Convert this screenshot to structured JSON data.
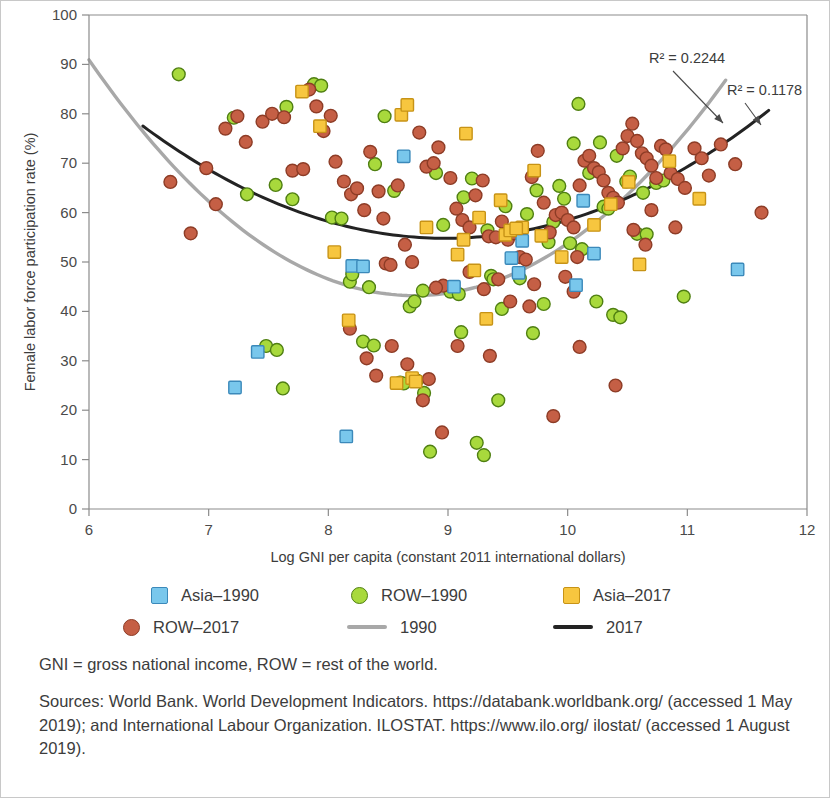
{
  "chart_data": {
    "type": "scatter",
    "title": "",
    "xlabel": "Log GNI per capita (constant 2011 international dollars)",
    "ylabel": "Female labor force participation rate (%)",
    "xlim": [
      6,
      12
    ],
    "ylim": [
      0,
      100
    ],
    "xticks": [
      6,
      7,
      8,
      9,
      10,
      11,
      12
    ],
    "yticks": [
      0,
      10,
      20,
      30,
      40,
      50,
      60,
      70,
      80,
      90,
      100
    ],
    "grid": false,
    "legend_position": "below-plot",
    "annotations": [
      {
        "text": "R² = 0.2244",
        "target_series": "1990",
        "x": 11.3,
        "y": 76
      },
      {
        "text": "R² = 0.1178",
        "target_series": "2017",
        "x": 11.65,
        "y": 74
      }
    ],
    "series": [
      {
        "name": "Asia–1990",
        "marker": "square",
        "color": "#79c7ec",
        "points": [
          [
            7.22,
            24.6
          ],
          [
            7.41,
            31.8
          ],
          [
            8.15,
            14.7
          ],
          [
            8.2,
            49.2
          ],
          [
            8.29,
            49.1
          ],
          [
            8.63,
            71.4
          ],
          [
            9.53,
            50.8
          ],
          [
            9.59,
            47.8
          ],
          [
            10.13,
            62.4
          ],
          [
            10.22,
            51.7
          ],
          [
            11.42,
            48.5
          ],
          [
            9.05,
            45.0
          ],
          [
            9.62,
            54.3
          ],
          [
            10.07,
            45.3
          ]
        ]
      },
      {
        "name": "ROW–1990",
        "marker": "circle",
        "color": "#a8d93c",
        "points": [
          [
            6.75,
            88.0
          ],
          [
            7.21,
            79.2
          ],
          [
            7.32,
            63.7
          ],
          [
            7.56,
            65.6
          ],
          [
            7.65,
            81.4
          ],
          [
            7.7,
            62.7
          ],
          [
            7.88,
            86.0
          ],
          [
            7.94,
            85.7
          ],
          [
            7.48,
            33.0
          ],
          [
            7.57,
            32.2
          ],
          [
            7.62,
            24.4
          ],
          [
            8.03,
            59.0
          ],
          [
            8.11,
            58.8
          ],
          [
            8.18,
            46.0
          ],
          [
            8.2,
            47.5
          ],
          [
            8.34,
            44.9
          ],
          [
            8.39,
            69.8
          ],
          [
            8.47,
            79.5
          ],
          [
            8.55,
            64.4
          ],
          [
            8.29,
            33.9
          ],
          [
            8.38,
            33.1
          ],
          [
            8.6,
            25.6
          ],
          [
            8.63,
            25.4
          ],
          [
            8.68,
            41.0
          ],
          [
            8.72,
            42.0
          ],
          [
            8.74,
            26.0
          ],
          [
            8.8,
            23.5
          ],
          [
            8.79,
            44.2
          ],
          [
            8.85,
            11.6
          ],
          [
            8.96,
            57.5
          ],
          [
            9.02,
            44.0
          ],
          [
            9.09,
            43.5
          ],
          [
            9.11,
            35.8
          ],
          [
            9.13,
            63.1
          ],
          [
            9.2,
            66.9
          ],
          [
            9.24,
            13.4
          ],
          [
            9.3,
            10.9
          ],
          [
            9.33,
            56.4
          ],
          [
            9.36,
            47.2
          ],
          [
            9.38,
            46.5
          ],
          [
            9.42,
            22.0
          ],
          [
            9.48,
            61.3
          ],
          [
            9.55,
            55.8
          ],
          [
            9.6,
            46.7
          ],
          [
            9.66,
            59.7
          ],
          [
            9.71,
            35.6
          ],
          [
            9.74,
            64.5
          ],
          [
            9.8,
            41.5
          ],
          [
            9.88,
            58.1
          ],
          [
            9.93,
            65.4
          ],
          [
            9.97,
            62.8
          ],
          [
            10.02,
            53.8
          ],
          [
            10.05,
            74.0
          ],
          [
            10.09,
            82.0
          ],
          [
            10.12,
            52.6
          ],
          [
            10.18,
            68.0
          ],
          [
            10.24,
            42.0
          ],
          [
            10.3,
            61.2
          ],
          [
            10.34,
            60.8
          ],
          [
            10.38,
            39.3
          ],
          [
            10.44,
            38.8
          ],
          [
            10.49,
            66.3
          ],
          [
            10.52,
            67.3
          ],
          [
            10.58,
            55.7
          ],
          [
            10.66,
            55.6
          ],
          [
            10.74,
            66.0
          ],
          [
            10.8,
            66.5
          ],
          [
            10.97,
            43.0
          ],
          [
            8.9,
            68.0
          ],
          [
            9.45,
            40.5
          ],
          [
            10.27,
            74.2
          ],
          [
            10.41,
            71.5
          ],
          [
            9.84,
            54.0
          ],
          [
            10.63,
            64.0
          ]
        ]
      },
      {
        "name": "Asia–2017",
        "marker": "square",
        "color": "#f7c63f",
        "points": [
          [
            7.78,
            84.5
          ],
          [
            7.93,
            77.5
          ],
          [
            8.61,
            79.8
          ],
          [
            8.66,
            81.8
          ],
          [
            8.05,
            52.0
          ],
          [
            8.17,
            38.2
          ],
          [
            8.57,
            25.5
          ],
          [
            8.7,
            26.5
          ],
          [
            8.73,
            25.8
          ],
          [
            8.82,
            57.0
          ],
          [
            9.08,
            51.5
          ],
          [
            9.13,
            54.5
          ],
          [
            9.22,
            48.3
          ],
          [
            9.26,
            59.0
          ],
          [
            9.32,
            38.5
          ],
          [
            9.44,
            62.5
          ],
          [
            9.48,
            55.5
          ],
          [
            9.52,
            56.4
          ],
          [
            9.62,
            57.0
          ],
          [
            9.72,
            68.5
          ],
          [
            9.78,
            55.3
          ],
          [
            9.95,
            51.0
          ],
          [
            10.22,
            57.5
          ],
          [
            10.36,
            61.7
          ],
          [
            10.51,
            66.2
          ],
          [
            10.85,
            70.4
          ],
          [
            11.1,
            62.8
          ],
          [
            9.15,
            76.0
          ],
          [
            9.57,
            56.8
          ],
          [
            10.6,
            49.5
          ]
        ]
      },
      {
        "name": "ROW–2017",
        "marker": "circle",
        "color": "#c55f45",
        "points": [
          [
            6.68,
            66.2
          ],
          [
            6.85,
            55.8
          ],
          [
            6.98,
            69.0
          ],
          [
            7.06,
            61.7
          ],
          [
            7.14,
            77.0
          ],
          [
            7.24,
            79.5
          ],
          [
            7.31,
            74.3
          ],
          [
            7.45,
            78.4
          ],
          [
            7.53,
            80.0
          ],
          [
            7.63,
            79.3
          ],
          [
            7.7,
            68.5
          ],
          [
            7.79,
            68.8
          ],
          [
            7.84,
            84.9
          ],
          [
            7.9,
            81.5
          ],
          [
            7.96,
            76.5
          ],
          [
            8.02,
            79.6
          ],
          [
            8.06,
            70.3
          ],
          [
            8.13,
            66.3
          ],
          [
            8.19,
            63.7
          ],
          [
            8.24,
            64.9
          ],
          [
            8.3,
            60.5
          ],
          [
            8.35,
            72.3
          ],
          [
            8.42,
            64.3
          ],
          [
            8.48,
            49.7
          ],
          [
            8.52,
            49.4
          ],
          [
            8.58,
            65.5
          ],
          [
            8.64,
            53.5
          ],
          [
            8.7,
            50.0
          ],
          [
            8.76,
            76.2
          ],
          [
            8.82,
            69.3
          ],
          [
            8.88,
            70.0
          ],
          [
            8.92,
            73.2
          ],
          [
            8.18,
            36.5
          ],
          [
            8.32,
            30.5
          ],
          [
            8.4,
            27.0
          ],
          [
            8.53,
            33.0
          ],
          [
            8.66,
            29.3
          ],
          [
            8.79,
            22.0
          ],
          [
            8.84,
            26.3
          ],
          [
            8.95,
            15.5
          ],
          [
            9.02,
            67.0
          ],
          [
            9.07,
            60.8
          ],
          [
            9.12,
            58.5
          ],
          [
            9.18,
            57.0
          ],
          [
            9.23,
            63.5
          ],
          [
            9.29,
            66.5
          ],
          [
            9.34,
            55.2
          ],
          [
            9.4,
            55.0
          ],
          [
            9.45,
            58.2
          ],
          [
            9.5,
            54.5
          ],
          [
            9.55,
            55.8
          ],
          [
            9.6,
            51.0
          ],
          [
            9.65,
            50.5
          ],
          [
            9.7,
            67.2
          ],
          [
            9.75,
            72.5
          ],
          [
            9.8,
            62.0
          ],
          [
            9.85,
            56.0
          ],
          [
            9.9,
            59.5
          ],
          [
            9.95,
            60.0
          ],
          [
            10.0,
            58.5
          ],
          [
            10.05,
            57.0
          ],
          [
            10.1,
            65.5
          ],
          [
            10.14,
            70.5
          ],
          [
            10.18,
            71.5
          ],
          [
            10.22,
            69.0
          ],
          [
            10.26,
            68.2
          ],
          [
            10.3,
            66.5
          ],
          [
            10.34,
            64.0
          ],
          [
            10.38,
            63.0
          ],
          [
            10.42,
            62.0
          ],
          [
            10.46,
            73.0
          ],
          [
            10.5,
            75.5
          ],
          [
            10.54,
            78.0
          ],
          [
            10.58,
            74.5
          ],
          [
            10.62,
            72.0
          ],
          [
            10.66,
            71.0
          ],
          [
            10.7,
            69.5
          ],
          [
            10.74,
            67.0
          ],
          [
            10.78,
            73.5
          ],
          [
            10.82,
            72.8
          ],
          [
            10.86,
            68.0
          ],
          [
            10.92,
            66.8
          ],
          [
            10.98,
            65.0
          ],
          [
            11.06,
            73.0
          ],
          [
            11.12,
            71.0
          ],
          [
            11.28,
            73.8
          ],
          [
            11.4,
            69.8
          ],
          [
            11.62,
            60.0
          ],
          [
            9.08,
            33.0
          ],
          [
            9.35,
            31.0
          ],
          [
            9.52,
            42.0
          ],
          [
            9.68,
            41.0
          ],
          [
            9.88,
            18.8
          ],
          [
            10.1,
            32.8
          ],
          [
            10.4,
            25.0
          ],
          [
            10.65,
            53.5
          ],
          [
            10.9,
            57.0
          ],
          [
            8.96,
            45.2
          ],
          [
            9.72,
            45.5
          ],
          [
            9.3,
            44.5
          ],
          [
            8.46,
            58.8
          ],
          [
            9.98,
            47.0
          ],
          [
            10.05,
            44.0
          ],
          [
            10.55,
            56.5
          ],
          [
            9.18,
            48.0
          ],
          [
            8.9,
            44.8
          ],
          [
            9.42,
            46.5
          ],
          [
            10.08,
            51.0
          ],
          [
            10.7,
            60.5
          ],
          [
            11.18,
            67.5
          ]
        ]
      }
    ],
    "trendlines": [
      {
        "name": "1990",
        "color": "#a8a8a8",
        "r_squared": "R² = 0.2244",
        "x_start": 6.0,
        "x_end": 11.32,
        "vertex_x": 8.72,
        "vertex_y": 43.2,
        "curvature": 6.45
      },
      {
        "name": "2017",
        "color": "#232323",
        "r_squared": "R² = 0.1178",
        "x_start": 6.45,
        "x_end": 11.68,
        "vertex_x": 8.98,
        "vertex_y": 54.8,
        "curvature": 3.55
      }
    ]
  },
  "legend": {
    "items": [
      {
        "label": "Asia–1990",
        "marker": "square",
        "color": "#79c7ec",
        "edge": "#3b89ba"
      },
      {
        "label": "ROW–1990",
        "marker": "circle",
        "color": "#a8d93c",
        "edge": "#4f7f12"
      },
      {
        "label": "Asia–2017",
        "marker": "square",
        "color": "#f7c63f",
        "edge": "#c79316"
      },
      {
        "label": "ROW–2017",
        "marker": "circle",
        "color": "#c55f45",
        "edge": "#8d3c26"
      },
      {
        "label": "1990",
        "marker": "line",
        "color": "#a8a8a8",
        "edge": "#a8a8a8"
      },
      {
        "label": "2017",
        "marker": "line",
        "color": "#232323",
        "edge": "#232323"
      }
    ]
  },
  "notes": {
    "abbreviations": "GNI = gross national income, ROW = rest of the world.",
    "sources": "Sources: World Bank. World Development Indicators. https://databank.worldbank.org/ (accessed 1 May 2019); and International Labour Organization. ILOSTAT. https://www.ilo.org/ ilostat/ (accessed 1 August 2019)."
  }
}
